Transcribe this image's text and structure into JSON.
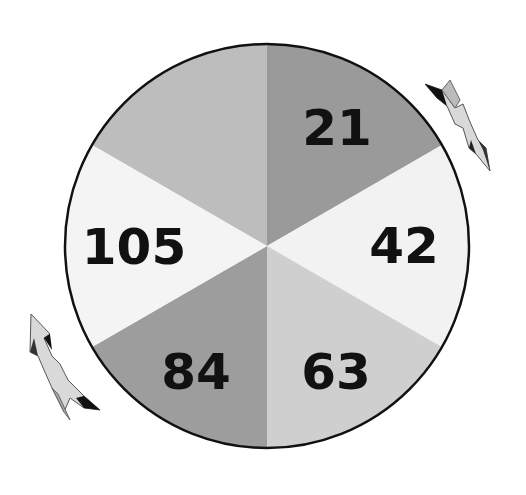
{
  "puzzle": {
    "center": {
      "x": 267,
      "y": 246
    },
    "radius": 202,
    "outline_color": "#111111",
    "segments": [
      {
        "position": "top-left",
        "value": "",
        "fill": "#bdbdbd",
        "start_deg": -90,
        "end_deg": -150
      },
      {
        "position": "top-right",
        "value": "21",
        "fill": "#9a9a9a",
        "start_deg": -90,
        "end_deg": -30
      },
      {
        "position": "right",
        "value": "42",
        "fill": "#f2f2f2",
        "start_deg": -30,
        "end_deg": 30
      },
      {
        "position": "bottom-right",
        "value": "63",
        "fill": "#cfcfcf",
        "start_deg": 30,
        "end_deg": 90
      },
      {
        "position": "bottom-left",
        "value": "84",
        "fill": "#9d9d9d",
        "start_deg": 90,
        "end_deg": 150
      },
      {
        "position": "left",
        "value": "105",
        "fill": "#f4f4f4",
        "start_deg": 150,
        "end_deg": 210
      }
    ],
    "labels": [
      {
        "segment": "top-right",
        "text": "21",
        "x": 337,
        "y": 145
      },
      {
        "segment": "right",
        "text": "42",
        "x": 404,
        "y": 263
      },
      {
        "segment": "bottom-right",
        "text": "63",
        "x": 336,
        "y": 389
      },
      {
        "segment": "bottom-left",
        "text": "84",
        "x": 196,
        "y": 389
      },
      {
        "segment": "left",
        "text": "105",
        "x": 134,
        "y": 264
      }
    ],
    "arrows": [
      {
        "name": "clockwise-arrow-top-right",
        "direction": "down-right"
      },
      {
        "name": "counterclockwise-arrow-bottom-left",
        "direction": "up-left"
      }
    ]
  }
}
